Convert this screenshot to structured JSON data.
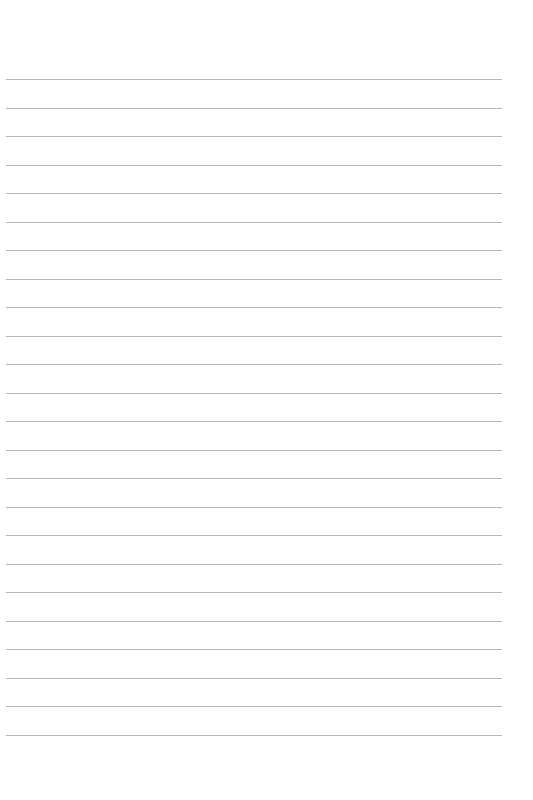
{
  "page": {
    "type": "lined-paper",
    "line_count": 24,
    "first_line_y": 79,
    "line_spacing": 28.5,
    "line_color": "#b8b8b8",
    "background": "#ffffff"
  }
}
